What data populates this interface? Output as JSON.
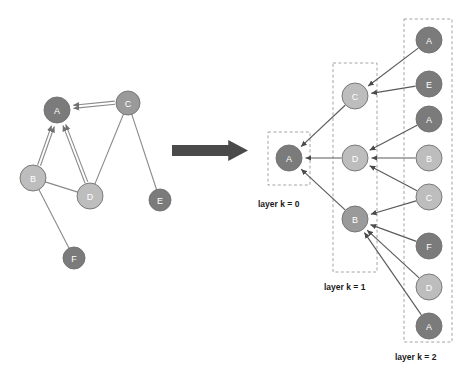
{
  "figure": {
    "title": "",
    "background": "#ffffff"
  },
  "palette": {
    "node_dark": "#7b7b7b",
    "node_mid": "#9a9a9a",
    "node_light": "#bdbdbd",
    "node_stroke": "#6f6f6f",
    "edge": "#8a8a8a",
    "tree_edge": "#5a5a5a",
    "dashed_box": "#9a9a9a",
    "big_arrow": "#4a4a4a",
    "label_text": "#1a1a1a",
    "node_text": "#ffffff"
  },
  "source_graph": {
    "name": "input-graph",
    "nodes": [
      {
        "id": "A",
        "label": "A",
        "cx": 57,
        "cy": 110,
        "r": 13,
        "shade": "node_dark"
      },
      {
        "id": "B",
        "label": "B",
        "cx": 33,
        "cy": 178,
        "r": 13,
        "shade": "node_light"
      },
      {
        "id": "C",
        "label": "C",
        "cx": 128,
        "cy": 103,
        "r": 12,
        "shade": "node_mid"
      },
      {
        "id": "D",
        "label": "D",
        "cx": 90,
        "cy": 196,
        "r": 13,
        "shade": "node_light"
      },
      {
        "id": "E",
        "label": "E",
        "cx": 160,
        "cy": 200,
        "r": 11,
        "shade": "node_dark"
      },
      {
        "id": "F",
        "label": "F",
        "cx": 74,
        "cy": 258,
        "r": 11,
        "shade": "node_dark"
      }
    ],
    "edges": [
      {
        "from": "B",
        "to": "A",
        "directed": true
      },
      {
        "from": "D",
        "to": "A",
        "directed": true
      },
      {
        "from": "C",
        "to": "A",
        "directed": true
      },
      {
        "from": "B",
        "to": "D",
        "directed": false
      },
      {
        "from": "C",
        "to": "D",
        "directed": false
      },
      {
        "from": "C",
        "to": "E",
        "directed": false
      },
      {
        "from": "B",
        "to": "F",
        "directed": false
      }
    ]
  },
  "transform_arrow": {
    "name": "transform-arrow",
    "direction": "right",
    "x": 172,
    "y": 140,
    "width": 76,
    "height": 21,
    "color": "#4a4a4a"
  },
  "computation_tree": {
    "name": "unrolled-tree",
    "layers": [
      {
        "key": "layer0",
        "label": "layer k = 0",
        "label_x": 258,
        "label_y": 205,
        "box": {
          "x": 268,
          "y": 132,
          "w": 42,
          "h": 53
        },
        "nodes": [
          {
            "id": "t-A0",
            "label": "A",
            "cx": 289,
            "cy": 158,
            "r": 13,
            "shade": "node_dark"
          }
        ]
      },
      {
        "key": "layer1",
        "label": "layer k = 1",
        "label_x": 324,
        "label_y": 288,
        "box": {
          "x": 333,
          "y": 63,
          "w": 44,
          "h": 209
        },
        "nodes": [
          {
            "id": "t-C1",
            "label": "C",
            "cx": 355,
            "cy": 96,
            "r": 13,
            "shade": "node_light"
          },
          {
            "id": "t-D1",
            "label": "D",
            "cx": 355,
            "cy": 158,
            "r": 13,
            "shade": "node_light"
          },
          {
            "id": "t-B1",
            "label": "B",
            "cx": 355,
            "cy": 219,
            "r": 13,
            "shade": "node_mid"
          }
        ]
      },
      {
        "key": "layer2",
        "label": "layer k = 2",
        "label_x": 395,
        "label_y": 358,
        "box": {
          "x": 404,
          "y": 19,
          "w": 48,
          "h": 323
        },
        "nodes": [
          {
            "id": "t-A2a",
            "label": "A",
            "cx": 429,
            "cy": 40,
            "r": 13,
            "shade": "node_dark"
          },
          {
            "id": "t-E2",
            "label": "E",
            "cx": 429,
            "cy": 84,
            "r": 13,
            "shade": "node_dark"
          },
          {
            "id": "t-A2b",
            "label": "A",
            "cx": 429,
            "cy": 119,
            "r": 13,
            "shade": "node_dark"
          },
          {
            "id": "t-B2",
            "label": "B",
            "cx": 429,
            "cy": 158,
            "r": 13,
            "shade": "node_light"
          },
          {
            "id": "t-C2",
            "label": "C",
            "cx": 429,
            "cy": 197,
            "r": 13,
            "shade": "node_light"
          },
          {
            "id": "t-F2",
            "label": "F",
            "cx": 429,
            "cy": 246,
            "r": 13,
            "shade": "node_dark"
          },
          {
            "id": "t-D2",
            "label": "D",
            "cx": 429,
            "cy": 287,
            "r": 13,
            "shade": "node_light"
          },
          {
            "id": "t-A2c",
            "label": "A",
            "cx": 429,
            "cy": 326,
            "r": 13,
            "shade": "node_dark"
          }
        ]
      }
    ],
    "edges": [
      {
        "from": "t-C1",
        "to": "t-A0",
        "directed": true
      },
      {
        "from": "t-D1",
        "to": "t-A0",
        "directed": true
      },
      {
        "from": "t-B1",
        "to": "t-A0",
        "directed": true
      },
      {
        "from": "t-A2a",
        "to": "t-C1",
        "directed": true
      },
      {
        "from": "t-E2",
        "to": "t-C1",
        "directed": true
      },
      {
        "from": "t-A2b",
        "to": "t-D1",
        "directed": true
      },
      {
        "from": "t-B2",
        "to": "t-D1",
        "directed": true
      },
      {
        "from": "t-C2",
        "to": "t-D1",
        "directed": true
      },
      {
        "from": "t-F2",
        "to": "t-B1",
        "directed": true
      },
      {
        "from": "t-D2",
        "to": "t-B1",
        "directed": true
      },
      {
        "from": "t-A2c",
        "to": "t-B1",
        "directed": true
      },
      {
        "from": "t-C2",
        "to": "t-B1",
        "directed": true
      }
    ]
  }
}
